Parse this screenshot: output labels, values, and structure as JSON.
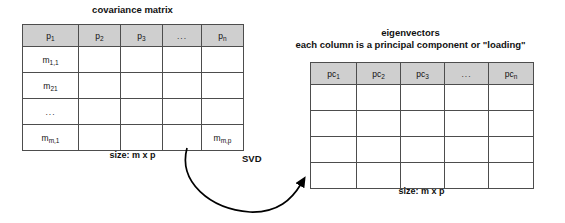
{
  "left_matrix": {
    "title": "covariance matrix",
    "caption": "size: m x p",
    "headers": [
      {
        "base": "p",
        "sub": "1"
      },
      {
        "base": "p",
        "sub": "2"
      },
      {
        "base": "p",
        "sub": "3"
      },
      {
        "base": "...",
        "sub": ""
      },
      {
        "base": "p",
        "sub": "n"
      }
    ],
    "rows": [
      [
        {
          "base": "m",
          "sub": "1,1"
        },
        {
          "base": "",
          "sub": ""
        },
        {
          "base": "",
          "sub": ""
        },
        {
          "base": "",
          "sub": ""
        },
        {
          "base": "",
          "sub": ""
        }
      ],
      [
        {
          "base": "m",
          "sub": "21"
        },
        {
          "base": "",
          "sub": ""
        },
        {
          "base": "",
          "sub": ""
        },
        {
          "base": "",
          "sub": ""
        },
        {
          "base": "",
          "sub": ""
        }
      ],
      [
        {
          "base": "...",
          "sub": ""
        },
        {
          "base": "",
          "sub": ""
        },
        {
          "base": "",
          "sub": ""
        },
        {
          "base": "",
          "sub": ""
        },
        {
          "base": "",
          "sub": ""
        }
      ],
      [
        {
          "base": "m",
          "sub": "m,1"
        },
        {
          "base": "",
          "sub": ""
        },
        {
          "base": "",
          "sub": ""
        },
        {
          "base": "",
          "sub": ""
        },
        {
          "base": "m",
          "sub": "m,p"
        }
      ]
    ]
  },
  "right_matrix": {
    "title_line1": "eigenvectors",
    "title_line2": "each column is a principal component or \"loading\"",
    "caption": "size: m x p",
    "headers": [
      {
        "base": "pc",
        "sub": "1"
      },
      {
        "base": "pc",
        "sub": "2"
      },
      {
        "base": "pc",
        "sub": "3"
      },
      {
        "base": "...",
        "sub": ""
      },
      {
        "base": "pc",
        "sub": "n"
      }
    ],
    "rows": [
      [
        {
          "base": "",
          "sub": ""
        },
        {
          "base": "",
          "sub": ""
        },
        {
          "base": "",
          "sub": ""
        },
        {
          "base": "",
          "sub": ""
        },
        {
          "base": "",
          "sub": ""
        }
      ],
      [
        {
          "base": "",
          "sub": ""
        },
        {
          "base": "",
          "sub": ""
        },
        {
          "base": "",
          "sub": ""
        },
        {
          "base": "",
          "sub": ""
        },
        {
          "base": "",
          "sub": ""
        }
      ],
      [
        {
          "base": "",
          "sub": ""
        },
        {
          "base": "",
          "sub": ""
        },
        {
          "base": "",
          "sub": ""
        },
        {
          "base": "",
          "sub": ""
        },
        {
          "base": "",
          "sub": ""
        }
      ],
      [
        {
          "base": "",
          "sub": ""
        },
        {
          "base": "",
          "sub": ""
        },
        {
          "base": "",
          "sub": ""
        },
        {
          "base": "",
          "sub": ""
        },
        {
          "base": "",
          "sub": ""
        }
      ]
    ]
  },
  "arrow": {
    "label": "SVD"
  },
  "colors": {
    "header_fill": "#cfcfcf",
    "border": "#4d4d4d",
    "text": "#111111",
    "background": "#ffffff",
    "arrow": "#000000"
  }
}
